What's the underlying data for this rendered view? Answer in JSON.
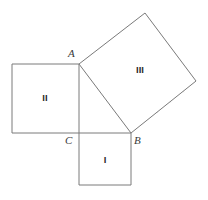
{
  "figure": {
    "background_color": "#ffffff",
    "outline_color": "#7a7a7a",
    "grid_color": "#cfcfcf",
    "label_color": "#2b2b2b"
  },
  "vertices": {
    "A": {
      "label": "A",
      "x": 79,
      "y": 64,
      "label_x": 68,
      "label_y": 57
    },
    "B": {
      "label": "B",
      "x": 131,
      "y": 133,
      "label_x": 134,
      "label_y": 144
    },
    "C": {
      "label": "C",
      "x": 79,
      "y": 133,
      "label_x": 65,
      "label_y": 144
    }
  },
  "squares": {
    "one": {
      "label": "I",
      "divisions": 3,
      "corners": "79,133 131,133 131,185 79,185",
      "label_x": 105,
      "label_y": 163
    },
    "two": {
      "label": "II",
      "divisions": 4,
      "corners": "12,64 79,64 79,133 12,133",
      "label_x": 45,
      "label_y": 101
    },
    "three": {
      "label": "III",
      "divisions": 5,
      "corners": "79,64 145,13 196,81 131,133",
      "label_x": 140,
      "label_y": 73
    }
  }
}
